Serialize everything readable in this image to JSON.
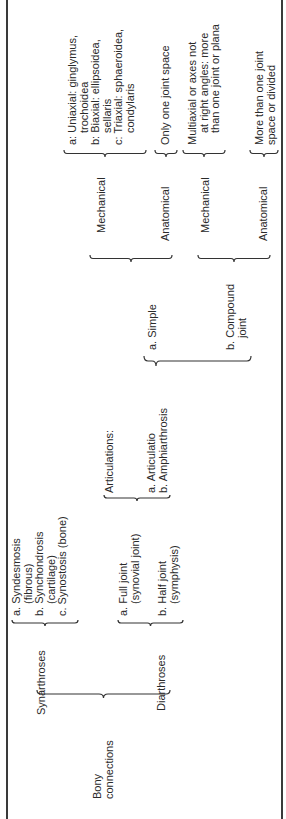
{
  "diagram": {
    "root": {
      "label": "Bony connections"
    },
    "synarthroses": {
      "label": "Synarthroses",
      "items": [
        {
          "prefix": "a.",
          "line1": "Syndesmosis",
          "line2": "(fibrous)"
        },
        {
          "prefix": "b.",
          "line1": "Synchondrosis",
          "line2": "(cartilage)"
        },
        {
          "prefix": "c.",
          "line1": "Synostosis (bone)",
          "line2": ""
        }
      ]
    },
    "diarthroses": {
      "label": "Diarthroses",
      "items": [
        {
          "prefix": "a.",
          "line1": "Full joint",
          "line2": "(synovial joint)"
        },
        {
          "prefix": "b.",
          "line1": "Half joint",
          "line2": "(symphysis)"
        }
      ]
    },
    "articulations": {
      "label": "Articulations:",
      "items": [
        {
          "prefix": "a.",
          "text": "Articulatio"
        },
        {
          "prefix": "b.",
          "text": "Amphiarthrosis"
        }
      ]
    },
    "joint_types": [
      {
        "prefix": "a.",
        "line1": "Simple",
        "line2": ""
      },
      {
        "prefix": "b.",
        "line1": "Compound",
        "line2": "joint"
      }
    ],
    "simple": {
      "mechanical": {
        "label": "Mechanical",
        "items": [
          {
            "line1": "a: Uniaxial: ginglymus,",
            "line2": "trochoidea"
          },
          {
            "line1": "b: Biaxial: ellipsoidea,",
            "line2": "sellaris"
          },
          {
            "line1": "c: Triaxial: sphaeroidea,",
            "line2": "condylaris"
          }
        ]
      },
      "anatomical": {
        "label": "Anatomical",
        "text": "Only one joint space"
      }
    },
    "compound": {
      "mechanical": {
        "label": "Mechanical",
        "line1": "Multiaxial or axes not",
        "line2": "at right angles: more",
        "line3": "than one joint or plana"
      },
      "anatomical": {
        "label": "Anatomical",
        "line1": "More than one joint",
        "line2": "space or divided"
      }
    }
  }
}
